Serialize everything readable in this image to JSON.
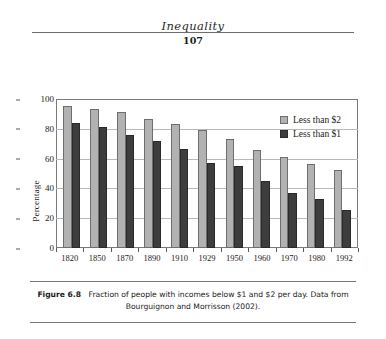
{
  "header": {
    "running_title": "Inequality",
    "page_number": "107"
  },
  "caption": {
    "figure_number": "Figure 6.8",
    "text": "Fraction of people with incomes below $1 and $2 per day. Data from Bourguignon and Morrisson (2002)."
  },
  "chart_data": {
    "type": "bar",
    "title": "",
    "xlabel": "",
    "ylabel": "Percentage",
    "ylim": [
      0,
      100
    ],
    "yticks": [
      "0",
      "20",
      "40",
      "60",
      "80",
      "100"
    ],
    "grid": true,
    "legend_position": "top-right",
    "categories": [
      "1820",
      "1850",
      "1870",
      "1890",
      "1910",
      "1929",
      "1950",
      "1960",
      "1970",
      "1980",
      "1992"
    ],
    "series": [
      {
        "name": "Less than $2",
        "color": "#b2b2b2",
        "values": [
          95,
          93.5,
          91,
          86.5,
          83,
          79,
          73,
          65.5,
          61,
          56.5,
          52.5
        ]
      },
      {
        "name": "Less than $1",
        "color": "#3d3d3d",
        "values": [
          84,
          81.5,
          76,
          72,
          66.5,
          57,
          55,
          45,
          37,
          33,
          25.5
        ]
      }
    ]
  }
}
